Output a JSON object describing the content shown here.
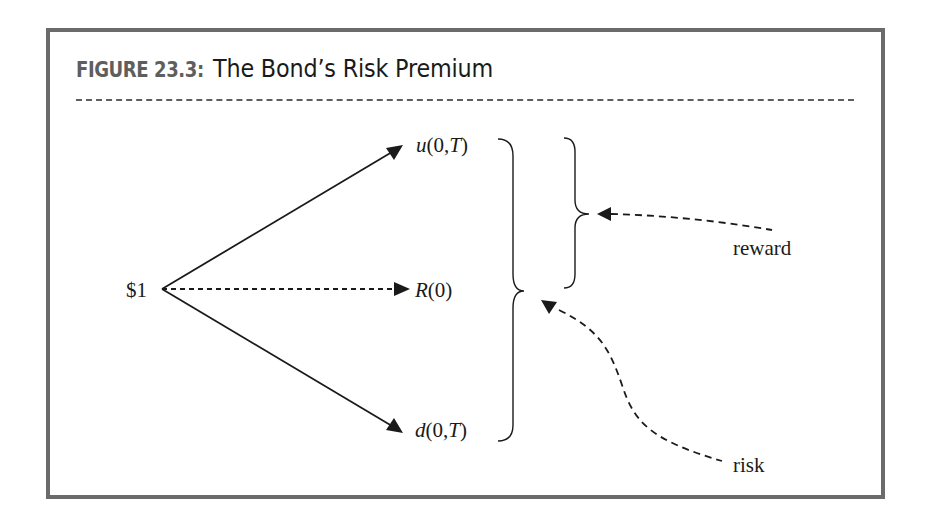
{
  "figure": {
    "number_label": "FIGURE 23.3:",
    "title": "The Bond’s Risk Premium"
  },
  "tree": {
    "root_label": "$1",
    "branches": [
      {
        "name": "up",
        "func": "u",
        "args": "(0,",
        "var": "T",
        "close": ")",
        "line_style": "solid"
      },
      {
        "name": "riskless",
        "func": "R",
        "args": "(0)",
        "var": "",
        "close": "",
        "line_style": "dashed"
      },
      {
        "name": "down",
        "func": "d",
        "args": "(0,",
        "var": "T",
        "close": ")",
        "line_style": "solid"
      }
    ]
  },
  "annotations": {
    "reward_label": "reward",
    "risk_label": "risk"
  },
  "colors": {
    "frame": "#6b6b6b",
    "ink": "#1a1a1a",
    "figure_number": "#5e5e5e"
  }
}
